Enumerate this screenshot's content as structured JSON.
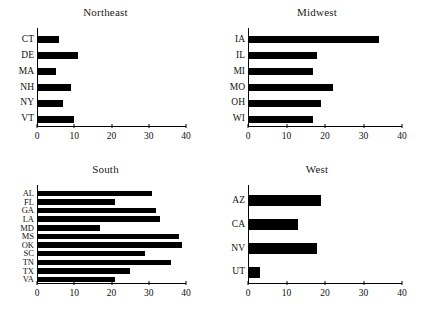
{
  "figure": {
    "background": "#ffffff",
    "bar_color": "#000000",
    "axis_color": "#000000"
  },
  "chart_data": [
    {
      "type": "bar",
      "title": "Northeast",
      "orientation": "horizontal",
      "categories": [
        "CT",
        "DE",
        "MA",
        "NH",
        "NY",
        "VT"
      ],
      "values": [
        6,
        11,
        5,
        9,
        7,
        10
      ],
      "xlabel": "",
      "ylabel": "",
      "xlim": [
        0,
        40
      ],
      "xticks": [
        0,
        10,
        20,
        30,
        40
      ],
      "xticklabels": [
        "0",
        "10",
        "20",
        "30",
        "40"
      ],
      "grid": false,
      "legend": "none"
    },
    {
      "type": "bar",
      "title": "Midwest",
      "orientation": "horizontal",
      "categories": [
        "IA",
        "IL",
        "MI",
        "MO",
        "OH",
        "WI"
      ],
      "values": [
        34,
        18,
        17,
        22,
        19,
        17
      ],
      "xlabel": "",
      "ylabel": "",
      "xlim": [
        0,
        40
      ],
      "xticks": [
        0,
        10,
        20,
        30,
        40
      ],
      "xticklabels": [
        "0",
        "10",
        "20",
        "30",
        "40"
      ],
      "grid": false,
      "legend": "none"
    },
    {
      "type": "bar",
      "title": "South",
      "orientation": "horizontal",
      "categories": [
        "AL",
        "FL",
        "GA",
        "LA",
        "MD",
        "MS",
        "OK",
        "SC",
        "TN",
        "TX",
        "VA"
      ],
      "values": [
        31,
        21,
        32,
        33,
        17,
        38,
        39,
        29,
        36,
        25,
        21
      ],
      "xlabel": "",
      "ylabel": "",
      "xlim": [
        0,
        40
      ],
      "xticks": [
        0,
        10,
        20,
        30,
        40
      ],
      "xticklabels": [
        "0",
        "10",
        "20",
        "30",
        "40"
      ],
      "grid": false,
      "legend": "none"
    },
    {
      "type": "bar",
      "title": "West",
      "orientation": "horizontal",
      "categories": [
        "AZ",
        "CA",
        "NV",
        "UT"
      ],
      "values": [
        19,
        13,
        18,
        3
      ],
      "xlabel": "",
      "ylabel": "",
      "xlim": [
        0,
        40
      ],
      "xticks": [
        0,
        10,
        20,
        30,
        40
      ],
      "xticklabels": [
        "0",
        "10",
        "20",
        "30",
        "40"
      ],
      "grid": false,
      "legend": "none"
    }
  ]
}
